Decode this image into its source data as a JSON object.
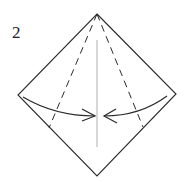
{
  "diagram": {
    "type": "origami-step",
    "step_number": "2",
    "colors": {
      "outline": "#2a2a2a",
      "center_crease": "#b0b0b0",
      "valley_fold": "#2a2a2a",
      "arrow": "#2a2a2a",
      "background": "#ffffff"
    },
    "shape": {
      "name": "square-diamond",
      "vertices": {
        "top": [
          97,
          14
        ],
        "right": [
          176,
          94
        ],
        "bottom": [
          97,
          176
        ],
        "left": [
          18,
          95
        ]
      }
    },
    "creases": [
      {
        "name": "center-crease",
        "style": "solid-light",
        "from": [
          97,
          40
        ],
        "to": [
          97,
          147
        ]
      },
      {
        "name": "left-valley-fold",
        "style": "dashed",
        "from": [
          97,
          14
        ],
        "to": [
          49,
          128
        ]
      },
      {
        "name": "right-valley-fold",
        "style": "dashed",
        "from": [
          97,
          14
        ],
        "to": [
          143,
          127
        ]
      }
    ],
    "arrows": [
      {
        "name": "left-fold-arrow",
        "direction": "toward-center",
        "from": [
          23,
          97
        ],
        "to": [
          95,
          116
        ]
      },
      {
        "name": "right-fold-arrow",
        "direction": "toward-center",
        "from": [
          167,
          96
        ],
        "to": [
          104,
          116
        ]
      }
    ]
  }
}
